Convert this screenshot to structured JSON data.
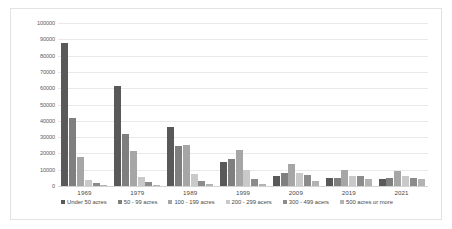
{
  "chart_data": {
    "type": "bar",
    "title": "",
    "subtitle": "",
    "xlabel": "",
    "ylabel": "",
    "grid": true,
    "legend_position": "bottom",
    "ylim": [
      0,
      100000
    ],
    "ytick_labels": [
      "100000",
      "90000",
      "80000",
      "70000",
      "60000",
      "50000",
      "40000",
      "30000",
      "20000",
      "10000",
      "0"
    ],
    "ytick_values": [
      100000,
      90000,
      80000,
      70000,
      60000,
      50000,
      40000,
      30000,
      20000,
      10000,
      0
    ],
    "categories": [
      "1969",
      "1979",
      "1989",
      "1999",
      "2009",
      "2019",
      "2021"
    ],
    "series": [
      {
        "name": "Under 50 acres",
        "color": "#595959",
        "values": [
          88000,
          61500,
          36500,
          14500,
          6000,
          5000,
          4500
        ]
      },
      {
        "name": "50 - 99 acres",
        "color": "#7f7f7f",
        "values": [
          42000,
          32000,
          24500,
          16500,
          8000,
          5000,
          5000
        ]
      },
      {
        "name": "100 - 199 acres",
        "color": "#a6a6a6",
        "values": [
          17500,
          21500,
          25000,
          22000,
          13500,
          10000,
          9000
        ]
      },
      {
        "name": "200 - 299 acers",
        "color": "#c9c9c9",
        "values": [
          3500,
          5500,
          7500,
          10000,
          8000,
          6000,
          6000
        ]
      },
      {
        "name": "300 - 499 acers",
        "color": "#8c8c8c",
        "values": [
          1800,
          2500,
          3000,
          4500,
          6500,
          6000,
          5000
        ]
      },
      {
        "name": "500 acres or more",
        "color": "#b3b3b3",
        "values": [
          400,
          700,
          1000,
          1500,
          3200,
          4500,
          4500
        ]
      }
    ]
  }
}
